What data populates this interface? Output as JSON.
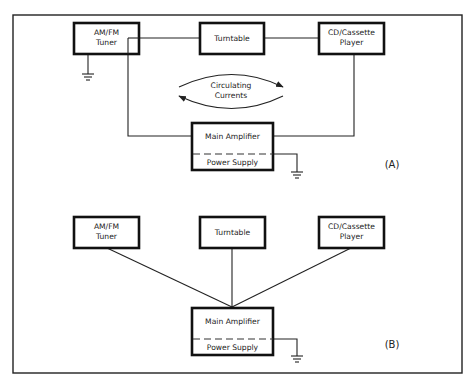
{
  "diagram": {
    "panel_a": {
      "label": "(A)",
      "components": {
        "tuner": [
          "AM/FM",
          "Tuner"
        ],
        "turntable": "Turntable",
        "cd": [
          "CD/Cassette",
          "Player"
        ],
        "amplifier": "Main Amplifier",
        "power_supply": "Power Supply"
      },
      "annotation": [
        "Circulating",
        "Currents"
      ]
    },
    "panel_b": {
      "label": "(B)",
      "components": {
        "tuner": [
          "AM/FM",
          "Tuner"
        ],
        "turntable": "Turntable",
        "cd": [
          "CD/Cassette",
          "Player"
        ],
        "amplifier": "Main Amplifier",
        "power_supply": "Power Supply"
      }
    }
  }
}
